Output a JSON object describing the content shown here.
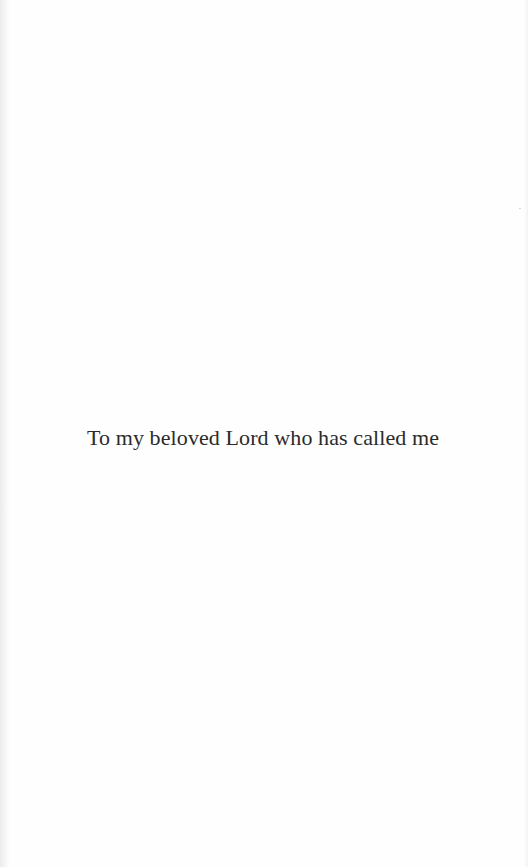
{
  "page": {
    "type": "dedication",
    "text": "To my beloved Lord who has called me"
  },
  "colors": {
    "background": "#fefefe",
    "text": "#2b2b2b",
    "gutter_shadow": "#ececec"
  }
}
